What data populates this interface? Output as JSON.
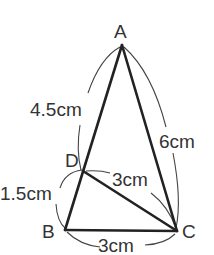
{
  "diagram": {
    "type": "triangle",
    "points": {
      "A": {
        "label": "A",
        "x": 122,
        "y": 45
      },
      "B": {
        "label": "B",
        "x": 65,
        "y": 230
      },
      "C": {
        "label": "C",
        "x": 177,
        "y": 231
      },
      "D": {
        "label": "D",
        "x": 83,
        "y": 171
      }
    },
    "measurements": {
      "AD": "4.5cm",
      "DB": "1.5cm",
      "AC": "6cm",
      "DC": "3cm",
      "BC": "3cm"
    }
  }
}
